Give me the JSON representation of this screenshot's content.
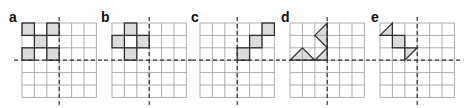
{
  "figure": {
    "grid": {
      "rows": 6,
      "cols": 6,
      "cell_px": 12.4,
      "line_color": "#9a9a9a",
      "axis_color": "#333333",
      "fill_color": "#dcdcdc",
      "stroke_color": "#333333"
    },
    "panels": [
      {
        "label": "a",
        "x": 22,
        "label_x": 9,
        "squares": [
          [
            0,
            0
          ],
          [
            2,
            0
          ],
          [
            1,
            1
          ],
          [
            0,
            2
          ],
          [
            2,
            2
          ]
        ],
        "polygons": []
      },
      {
        "label": "b",
        "x": 112,
        "label_x": 101,
        "squares": [
          [
            1,
            0
          ],
          [
            0,
            1
          ],
          [
            2,
            1
          ],
          [
            1,
            2
          ]
        ],
        "polygons": []
      },
      {
        "label": "c",
        "x": 200,
        "label_x": 191,
        "squares": [
          [
            5,
            0
          ],
          [
            4,
            1
          ],
          [
            3,
            2
          ]
        ],
        "polygons": []
      },
      {
        "label": "d",
        "x": 290,
        "label_x": 281,
        "squares": [],
        "polygons": [
          [
            [
              3,
              0
            ],
            [
              3,
              2
            ],
            [
              2,
              1
            ]
          ],
          [
            [
              0,
              3
            ],
            [
              1,
              2
            ],
            [
              2,
              3
            ]
          ],
          [
            [
              2,
              3
            ],
            [
              3,
              2
            ],
            [
              3,
              3
            ]
          ]
        ]
      },
      {
        "label": "e",
        "x": 380,
        "label_x": 371,
        "squares": [
          [
            1,
            1
          ]
        ],
        "polygons": [
          [
            [
              0,
              1
            ],
            [
              1,
              0
            ],
            [
              1,
              1
            ]
          ],
          [
            [
              2,
              2
            ],
            [
              3,
              2
            ],
            [
              2,
              3
            ]
          ]
        ]
      }
    ]
  }
}
